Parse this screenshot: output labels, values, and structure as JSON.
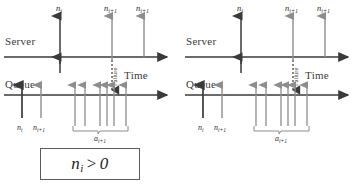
{
  "figure": {
    "type": "timing-diagram",
    "panel_count": 2
  },
  "panels": [
    {
      "id": "left",
      "case_label": {
        "symbol": "n",
        "subscript": "i",
        "operator": ">",
        "value": "0",
        "full": "n_i > 0"
      },
      "axes": [
        {
          "name": "server",
          "label": "Server",
          "time_label": ""
        },
        {
          "name": "queue",
          "label": "Queue",
          "time_label": "Time"
        }
      ],
      "time_label": "Time",
      "failure_label": "Failure",
      "server_up_arrows": [
        {
          "x": 60,
          "label_sym": "n",
          "label_sub": "i"
        },
        {
          "x": 112,
          "label_sym": "n",
          "label_sub": "i+1"
        },
        {
          "x": 144,
          "label_sym": "n",
          "label_sub": "i+1"
        }
      ],
      "queue_up_arrows_labeled": [
        {
          "x": 22,
          "label_sym": "n",
          "label_sub": "i",
          "dark": true
        },
        {
          "x": 41,
          "label_sym": "n",
          "label_sub": "i+1",
          "dark": false
        }
      ],
      "queue_group_arrows_x": [
        75,
        85,
        100,
        107,
        114,
        126
      ],
      "bracket_label": {
        "symbol": "a",
        "subscript": "i+1",
        "full": "a_i+1"
      }
    },
    {
      "id": "right",
      "case_label": {
        "symbol": "n",
        "subscript": "i",
        "operator": "=",
        "value": "0",
        "full": "n_i = 0"
      },
      "axes": [
        {
          "name": "server",
          "label": "Server",
          "time_label": ""
        },
        {
          "name": "queue",
          "label": "Queue",
          "time_label": "Time"
        }
      ],
      "time_label": "Time",
      "failure_label": "Failure",
      "server_up_arrows": [
        {
          "x": 60,
          "label_sym": "n",
          "label_sub": "i"
        },
        {
          "x": 112,
          "label_sym": "n",
          "label_sub": "i+1"
        },
        {
          "x": 144,
          "label_sym": "n",
          "label_sub": "i+1"
        }
      ],
      "queue_up_arrows_labeled": [
        {
          "x": 22,
          "label_sym": "n",
          "label_sub": "i",
          "dark": true
        },
        {
          "x": 41,
          "label_sym": "n",
          "label_sub": "i+1",
          "dark": false
        }
      ],
      "queue_group_arrows_x": [
        75,
        85,
        100,
        107,
        114,
        126
      ],
      "bracket_label": {
        "symbol": "a",
        "subscript": "i+1",
        "full": "a_i+1"
      }
    }
  ],
  "labels": {
    "server": "Server",
    "queue": "Queue",
    "time": "Time",
    "failure": "Failure",
    "n_symbol": "n",
    "a_symbol": "a",
    "sub_i": "i",
    "sub_i1": "i+1",
    "left_case_lhs": "n",
    "left_case_sub": "i",
    "left_case_op": ">",
    "left_case_rhs": "0",
    "right_case_lhs": "n",
    "right_case_sub": "i",
    "right_case_op": "=",
    "right_case_rhs": "0"
  },
  "colors": {
    "ink": "#2b2b2b",
    "axis": "#3a3a3a",
    "arrow_dark": "#3a3a3a",
    "arrow_gray": "#8d8d8d",
    "box_border": "#5a5a5a",
    "background": "#ffffff"
  }
}
